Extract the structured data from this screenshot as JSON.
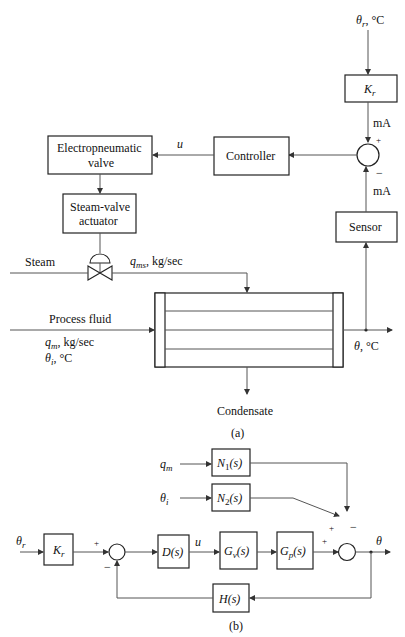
{
  "diagram_a": {
    "caption": "(a)",
    "reference_label": "θr, °C",
    "kr_block": "Kr",
    "ma_top": "mA",
    "ma_bottom": "mA",
    "plus_sign": "+",
    "minus_sign": "−",
    "controller": "Controller",
    "u_label": "u",
    "electropneumatic_line1": "Electropneumatic",
    "electropneumatic_line2": "valve",
    "actuator_line1": "Steam-valve",
    "actuator_line2": "actuator",
    "sensor": "Sensor",
    "steam": "Steam",
    "steam_flow": "qms, kg/sec",
    "process_fluid": "Process fluid",
    "process_flow": "qm, kg/sec",
    "inlet_temp": "θi, °C",
    "outlet_temp": "θ, °C",
    "condensate": "Condensate"
  },
  "diagram_b": {
    "caption": "(b)",
    "theta_r": "θr",
    "kr": "Kr",
    "d": "D(s)",
    "u": "u",
    "gv": "Gv(s)",
    "gp": "Gp(s)",
    "h": "H(s)",
    "qm": "qm",
    "theta_i": "θi",
    "n1": "N1(s)",
    "n2": "N2(s)",
    "theta": "θ",
    "signs": {
      "sum1_plus": "+",
      "sum1_minus": "−",
      "sum2_plus_left": "+",
      "sum2_plus_top": "+",
      "sum2_minus": "−"
    }
  }
}
